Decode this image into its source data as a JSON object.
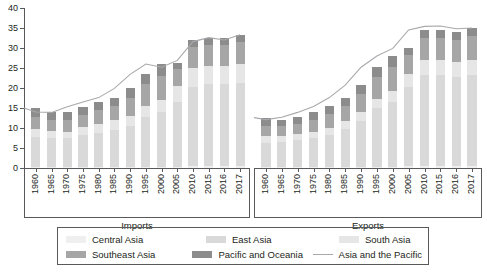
{
  "chart_data": {
    "type": "bar",
    "title": "",
    "xlabel": "",
    "ylabel": "",
    "ylim": [
      0,
      40
    ],
    "yticks": [
      0,
      5,
      10,
      15,
      20,
      25,
      30,
      35,
      40
    ],
    "grid": false,
    "legend_position": "bottom",
    "stacked": true,
    "panels": [
      {
        "name": "imports",
        "label": "Imports",
        "categories": [
          "1960",
          "1965",
          "1970",
          "1975",
          "1980",
          "1985",
          "1990",
          "1995",
          "2000",
          "2005",
          "2010",
          "2015",
          "2016",
          "2017"
        ],
        "series": [
          {
            "name": "Central Asia",
            "color": "#efefef",
            "values": [
              0.2,
              0.2,
              0.2,
              0.2,
              0.2,
              0.2,
              0.2,
              0.3,
              0.3,
              0.3,
              0.4,
              0.4,
              0.4,
              0.4
            ]
          },
          {
            "name": "East Asia",
            "color": "#d9d9d9",
            "values": [
              7.6,
              7.3,
              7.3,
              8.1,
              8.6,
              9.3,
              10.4,
              12.4,
              13.7,
              16.2,
              19.8,
              20.5,
              20.6,
              20.9
            ]
          },
          {
            "name": "South Asia",
            "color": "#e6e6e6",
            "values": [
              1.9,
              1.7,
              1.6,
              1.9,
              2.3,
              2.4,
              2.5,
              2.8,
              3.1,
              3.9,
              4.7,
              4.6,
              4.5,
              4.7
            ]
          },
          {
            "name": "Southeast Asia",
            "color": "#a6a6a6",
            "values": [
              3.0,
              2.9,
              2.9,
              3.1,
              3.4,
              3.6,
              4.5,
              5.5,
              6.0,
              4.4,
              5.3,
              5.3,
              5.3,
              5.4
            ]
          },
          {
            "name": "Pacific and Oceania",
            "color": "#8c8c8c",
            "values": [
              2.3,
              1.9,
              1.9,
              2.0,
              2.0,
              2.1,
              2.3,
              2.4,
              2.8,
              1.4,
              1.7,
              1.8,
              1.8,
              1.9
            ]
          }
        ],
        "line": {
          "name": "Asia and the Pacific",
          "color": "#a7a9ac",
          "values": [
            15.0,
            14.0,
            13.9,
            15.3,
            16.5,
            17.6,
            19.9,
            23.4,
            26.0,
            25.2,
            26.9,
            31.6,
            32.6,
            32.0,
            33.3
          ]
        }
      },
      {
        "name": "exports",
        "label": "Exports",
        "categories": [
          "1960",
          "1965",
          "1970",
          "1975",
          "1980",
          "1985",
          "1990",
          "1995",
          "2000",
          "2005",
          "2010",
          "2015",
          "2016",
          "2017"
        ],
        "series": [
          {
            "name": "Central Asia",
            "color": "#efefef",
            "values": [
              0.2,
              0.2,
              0.2,
              0.2,
              0.2,
              0.2,
              0.2,
              0.3,
              0.3,
              0.4,
              0.5,
              0.4,
              0.4,
              0.4
            ]
          },
          {
            "name": "East Asia",
            "color": "#d9d9d9",
            "values": [
              6.0,
              6.2,
              6.7,
              7.3,
              8.0,
              9.6,
              11.6,
              14.6,
              16.3,
              19.8,
              22.7,
              22.8,
              22.4,
              22.8
            ]
          },
          {
            "name": "South Asia",
            "color": "#e6e6e6",
            "values": [
              1.7,
              1.5,
              1.5,
              1.6,
              1.8,
              1.9,
              2.1,
              2.4,
              2.6,
              3.2,
              3.8,
              3.7,
              3.7,
              3.9
            ]
          },
          {
            "name": "Southeast Asia",
            "color": "#a6a6a6",
            "values": [
              2.7,
              2.5,
              2.6,
              3.0,
              3.5,
              3.8,
              4.5,
              5.4,
              6.0,
              4.9,
              5.6,
              5.6,
              5.6,
              5.8
            ]
          },
          {
            "name": "Pacific and Oceania",
            "color": "#8c8c8c",
            "values": [
              2.0,
              1.7,
              1.7,
              1.8,
              1.9,
              2.1,
              2.3,
              2.5,
              2.8,
              1.6,
              1.9,
              2.0,
              2.0,
              2.1
            ]
          }
        ],
        "line": {
          "name": "Asia and the Pacific",
          "color": "#a7a9ac",
          "values": [
            12.6,
            12.1,
            12.7,
            13.9,
            15.4,
            17.6,
            20.7,
            25.2,
            28.0,
            29.9,
            34.5,
            35.4,
            35.5,
            34.8,
            35.0
          ]
        }
      }
    ],
    "legend": [
      {
        "label": "Central Asia",
        "color": "#efefef",
        "type": "swatch"
      },
      {
        "label": "East Asia",
        "color": "#d9d9d9",
        "type": "swatch"
      },
      {
        "label": "South Asia",
        "color": "#e6e6e6",
        "type": "swatch"
      },
      {
        "label": "Southeast Asia",
        "color": "#a6a6a6",
        "type": "swatch"
      },
      {
        "label": "Pacific and Oceania",
        "color": "#8c8c8c",
        "type": "swatch"
      },
      {
        "label": "Asia and the Pacific",
        "color": "#a7a9ac",
        "type": "line"
      }
    ]
  },
  "caption": {
    "text": ""
  }
}
